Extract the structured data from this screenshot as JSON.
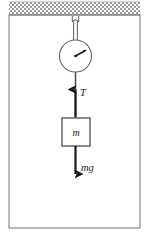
{
  "figure": {
    "background_color": "#ffffff",
    "stroke_color": "#4a4a4a",
    "dark_stroke_color": "#1a1a1a",
    "hatch_color": "#808080",
    "frame": {
      "x": 9,
      "y": 15,
      "width": 131,
      "height": 213,
      "border_color": "#8a8a8a"
    },
    "ceiling": {
      "label": "ceiling-support",
      "x": 9,
      "y": 2,
      "width": 131,
      "height": 13,
      "pattern": "crosshatch"
    },
    "hook": {
      "label": "hook-ring",
      "center_x": 75,
      "center_y": 18,
      "radius": 3
    },
    "rod_upper": {
      "label": "suspension-rod",
      "x1": 75,
      "y1": 17,
      "y2": 41
    },
    "dial": {
      "label": "spring-scale-dial",
      "center_x": 75.5,
      "center_y": 56,
      "radius": 16,
      "needle_angle_deg": -28,
      "needle_length": 11,
      "hub_radius": 1.2
    },
    "rod_lower": {
      "label": "scale-to-block-line",
      "x1": 75.5,
      "y1": 72,
      "y2": 118
    },
    "block": {
      "label": "mass-block",
      "x": 62,
      "y": 118,
      "width": 28,
      "height": 28,
      "mass_label": "m"
    },
    "tension_arrow": {
      "label": "tension-arrow",
      "direction": "up",
      "x": 75.5,
      "tail_y": 117,
      "head_y": 88,
      "text": "T",
      "text_x": 80,
      "text_y": 95
    },
    "weight_arrow": {
      "label": "weight-arrow",
      "direction": "down",
      "x": 75.5,
      "tail_y": 146,
      "head_y": 176,
      "text": "mg",
      "text_x": 81,
      "text_y": 170
    }
  }
}
